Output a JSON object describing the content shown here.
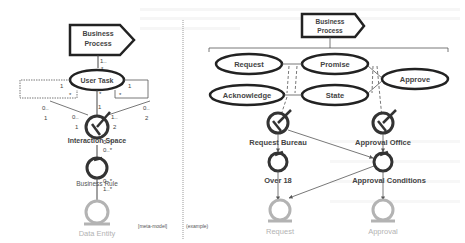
{
  "meta_model": {
    "process": {
      "line1": "Business",
      "line2": "Process"
    },
    "user_task": "User Task",
    "interaction_space": "Interaction Space",
    "business_rule": "Business Rule",
    "data_entity": "Data Entity",
    "caption": "[meta-model]",
    "multiplicities": {
      "process_top": "1..",
      "process_bottom": "*",
      "task_left_1": "1",
      "task_left_star": "*",
      "task_right_1": "1",
      "task_right_star": "*",
      "task_bottom_star": "*",
      "space_top_1": "1",
      "left_0": "0..",
      "left_1": "1",
      "right_0": "0..",
      "right_2": "2",
      "inner_left_0": "0..",
      "inner_left_1": "1",
      "inner_right_1": "1..",
      "inner_right_2": "2",
      "space_rule_0a": "0..*",
      "space_rule_0b": "0..*",
      "rule_entity_0": "0..*",
      "rule_entity_1": "1..*"
    }
  },
  "example": {
    "process": {
      "line1": "Business",
      "line2": "Process"
    },
    "tasks": [
      "Request",
      "Promise",
      "Approve",
      "Acknowledge",
      "State"
    ],
    "spaces": [
      "Request Bureau",
      "Approval Office"
    ],
    "rules": [
      "Over 18",
      "Approval Conditions"
    ],
    "entities": [
      "Request",
      "Approval"
    ],
    "caption": "(example)"
  },
  "colors": {
    "stroke": "#333333",
    "entity": "#b3b3b3",
    "text": "#444444",
    "divider": "#999999"
  }
}
